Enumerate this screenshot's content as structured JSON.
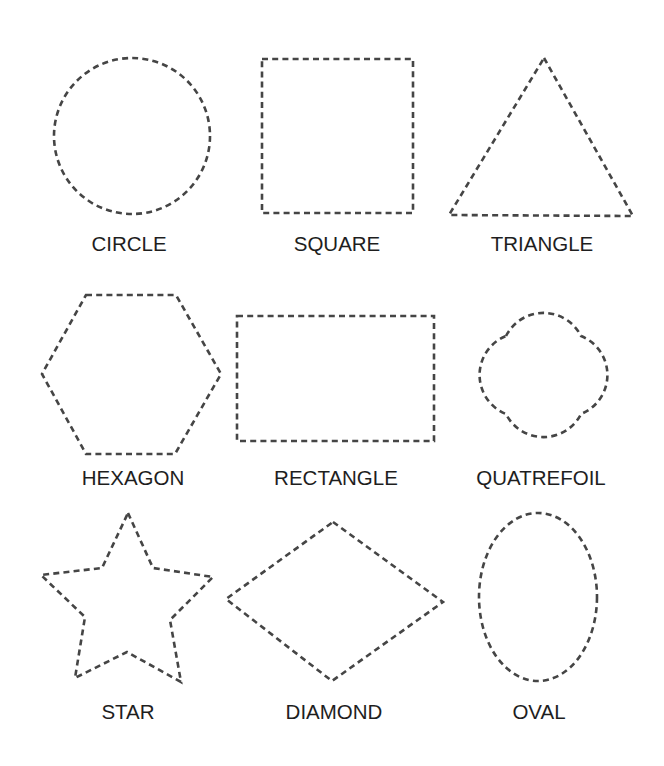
{
  "worksheet": {
    "stroke_color": "#454545",
    "label_color": "#1e1e1e",
    "shapes": [
      {
        "id": "circle",
        "label": "CIRCLE"
      },
      {
        "id": "square",
        "label": "SQUARE"
      },
      {
        "id": "triangle",
        "label": "TRIANGLE"
      },
      {
        "id": "hexagon",
        "label": "HEXAGON"
      },
      {
        "id": "rectangle",
        "label": "RECTANGLE"
      },
      {
        "id": "quatrefoil",
        "label": "QUATREFOIL"
      },
      {
        "id": "star",
        "label": "STAR"
      },
      {
        "id": "diamond",
        "label": "DIAMOND"
      },
      {
        "id": "oval",
        "label": "OVAL"
      }
    ]
  }
}
